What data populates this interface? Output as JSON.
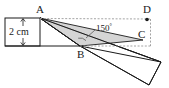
{
  "figure": {
    "background_color": "#ffffff",
    "line_color": "#1a1a1a",
    "dashed_color": "#9a9a9a",
    "shade_color": "#c9c9c9",
    "labels": {
      "vertex_a": "A",
      "vertex_b": "B",
      "vertex_c": "C",
      "vertex_d": "D",
      "angle": "150",
      "degree_symbol": "°",
      "width_measure": "2 cm"
    },
    "geometry": {
      "point_a": {
        "x": 40,
        "y": 18
      },
      "point_b": {
        "x": 80,
        "y": 46
      },
      "point_c": {
        "x": 140,
        "y": 40
      },
      "point_d": {
        "x": 147,
        "y": 19
      },
      "strip_left_rect": {
        "x": 5,
        "y": 18,
        "width": 35,
        "height": 28
      },
      "rotated_strip": "40,18 160,63 148,84 80,46",
      "shaded_triangle": "40,18 80,46 143,40",
      "dashed_top": "40,18 150,19",
      "dashed_right": "150,19 150,46",
      "dashed_bottom": "80,46 150,46",
      "dimension_x": 23,
      "dimension_top_y": 19,
      "dimension_bottom_y": 45
    }
  }
}
